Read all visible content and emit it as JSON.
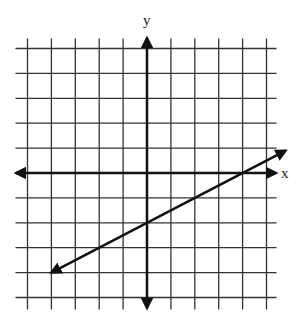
{
  "chart_data": {
    "type": "line",
    "title": "",
    "xlabel": "x",
    "ylabel": "y",
    "xlim": [
      -5,
      5
    ],
    "ylim": [
      -5,
      5
    ],
    "grid": true,
    "grid_step": 1,
    "tick_labels": false,
    "series": [
      {
        "name": "line",
        "equation": "y = 0.5x - 2",
        "slope": 0.5,
        "intercept": -2,
        "x": [
          -4,
          5.8
        ],
        "y": [
          -4,
          0.9
        ],
        "arrows": "both"
      }
    ],
    "key_points": [
      {
        "label": "y-intercept",
        "x": 0,
        "y": -2
      },
      {
        "label": "x-intercept",
        "x": 4,
        "y": 0
      }
    ]
  },
  "labels": {
    "x_axis": "x",
    "y_axis": "y"
  },
  "colors": {
    "grid": "#333333",
    "axis": "#111111",
    "line": "#111111"
  }
}
